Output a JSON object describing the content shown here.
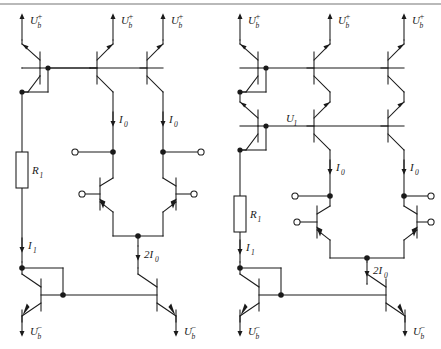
{
  "figure": {
    "type": "circuit-schematic",
    "title": "",
    "background_color": "#ffffff",
    "line_color": "#1a1a1a",
    "top_rule_color": "#b9b9b9"
  },
  "labels": {
    "supply_positive": "U",
    "supply_positive_sub": "b",
    "supply_positive_sup": "+",
    "supply_negative": "U",
    "supply_negative_sub": "b",
    "supply_negative_sup": "−",
    "resistor": "R",
    "resistor_sub": "1",
    "current_i1": "I",
    "current_i1_sub": "1",
    "current_i0": "I",
    "current_i0_sub": "0",
    "current_2i0": "2I",
    "current_2i0_sub": "0",
    "node_u1": "U",
    "node_u1_sub": "1"
  },
  "circuits": [
    {
      "name": "left-circuit",
      "id": "simple-current-mirror",
      "supply_rails_positive": 3,
      "supply_rails_negative": 2,
      "components": {
        "pnp_transistors": 3,
        "npn_transistors": 4,
        "resistors": 1,
        "input_terminals": 2,
        "output_terminals": 2
      },
      "annotations": [
        "U_b^+",
        "U_b^+",
        "U_b^+",
        "R_1",
        "I_0",
        "I_0",
        "I_1",
        "2I_0",
        "U_b^-",
        "U_b^-"
      ]
    },
    {
      "name": "right-circuit",
      "id": "cascode-current-mirror",
      "supply_rails_positive": 3,
      "supply_rails_negative": 2,
      "components": {
        "pnp_transistors": 6,
        "npn_transistors": 4,
        "resistors": 1,
        "input_terminals": 2,
        "output_terminals": 2
      },
      "annotations": [
        "U_b^+",
        "U_b^+",
        "U_b^+",
        "U_1",
        "R_1",
        "I_0",
        "I_0",
        "I_1",
        "2I_0",
        "U_b^-",
        "U_b^-"
      ]
    }
  ]
}
